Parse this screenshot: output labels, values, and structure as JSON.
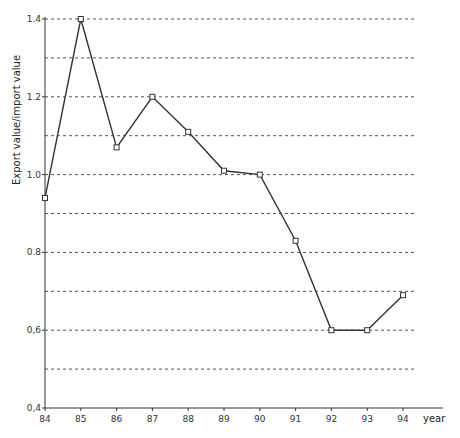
{
  "chart_data": {
    "type": "line",
    "title": "",
    "xlabel": "year",
    "ylabel": "Export value/import value",
    "categories": [
      "84",
      "85",
      "86",
      "87",
      "88",
      "89",
      "90",
      "91",
      "92",
      "93",
      "94"
    ],
    "series": [
      {
        "name": "Export value/import value",
        "values": [
          0.94,
          1.4,
          1.07,
          1.2,
          1.11,
          1.01,
          1.0,
          0.83,
          0.6,
          0.6,
          0.69
        ]
      }
    ],
    "ylim": [
      0.4,
      1.4
    ],
    "yticks": [
      0.4,
      0.6,
      0.8,
      1.0,
      1.2,
      1.4
    ],
    "ytick_labels": [
      "0,4",
      "0,6",
      "0.8",
      "1.0",
      "1.2",
      "1.4"
    ],
    "gridlines": [
      0.5,
      0.6,
      0.7,
      0.8,
      0.9,
      1.0,
      1.1,
      1.2,
      1.3,
      1.4
    ],
    "grid": "horizontal dashed",
    "legend": "none",
    "marker": "open square",
    "line_color": "#333333"
  }
}
